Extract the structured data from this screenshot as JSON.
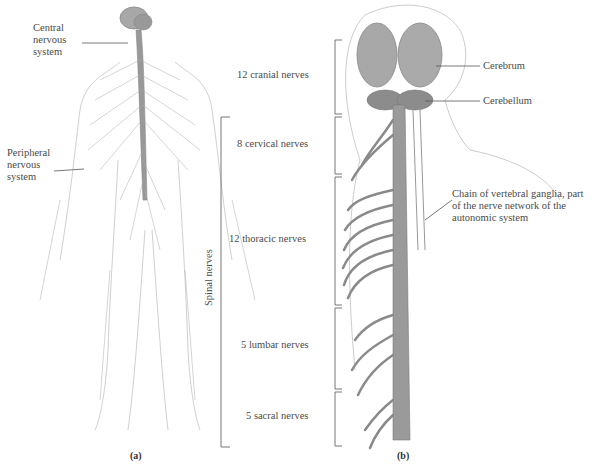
{
  "figure_a": {
    "labels": {
      "cns": "Central nervous system",
      "cns_l1": "Central",
      "cns_l2": "nervous",
      "cns_l3": "system",
      "pns_l1": "Peripheral",
      "pns_l2": "nervous",
      "pns_l3": "system"
    },
    "caption": "(a)"
  },
  "figure_b": {
    "brackets": [
      {
        "label": "12 cranial nerves"
      },
      {
        "label": "8 cervical nerves"
      },
      {
        "label": "12 thoracic nerves"
      },
      {
        "label": "5 lumbar nerves"
      },
      {
        "label": "5 sacral nerves"
      }
    ],
    "spinal_label": "Spinal nerves",
    "callouts": {
      "cerebrum": "Cerebrum",
      "cerebellum": "Cerebellum",
      "ganglia_l1": "Chain of vertebral ganglia, part",
      "ganglia_l2": "of the nerve network of the",
      "ganglia_l3": "autonomic system"
    },
    "caption": "(b)"
  },
  "colors": {
    "nerve": "#8a8a8a",
    "brain": "#a8a8a8",
    "line": "#666666"
  }
}
